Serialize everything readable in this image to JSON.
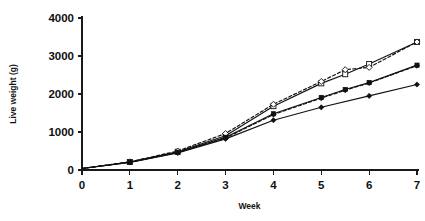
{
  "chart_data": {
    "type": "line",
    "title": "",
    "subtitle": "",
    "xlabel": "Week",
    "ylabel": "Live weight (g)",
    "xlim": [
      0,
      7
    ],
    "ylim": [
      0,
      4000
    ],
    "xticks": [
      0,
      1,
      2,
      3,
      4,
      5,
      6,
      7
    ],
    "xticklabels": [
      "0",
      "1",
      "2",
      "3",
      "4",
      "5",
      "6",
      "7"
    ],
    "yticks": [
      0,
      1000,
      2000,
      3000,
      4000
    ],
    "yticklabels": [
      "0",
      "1000",
      "2000",
      "3000",
      "4000"
    ],
    "grid": false,
    "legend": "none",
    "series": [
      {
        "name": "open-square-solid",
        "marker": "open-square",
        "linestyle": "solid",
        "x": [
          0,
          1,
          2,
          3,
          4,
          5,
          5.5,
          6,
          7
        ],
        "y": [
          40,
          210,
          480,
          900,
          1680,
          2280,
          2520,
          2790,
          3370
        ]
      },
      {
        "name": "open-diamond-dashed",
        "marker": "open-diamond",
        "linestyle": "dashed",
        "x": [
          0,
          1,
          2,
          3,
          4,
          5,
          5.5,
          6,
          7
        ],
        "y": [
          40,
          215,
          500,
          960,
          1730,
          2330,
          2640,
          2700,
          3370
        ]
      },
      {
        "name": "filled-square-solid",
        "marker": "filled-square",
        "linestyle": "solid",
        "x": [
          0,
          1,
          2,
          3,
          4,
          5,
          5.5,
          6,
          7
        ],
        "y": [
          40,
          205,
          465,
          860,
          1480,
          1910,
          2120,
          2300,
          2760
        ]
      },
      {
        "name": "filled-diamond-dashed",
        "marker": "filled-diamond",
        "linestyle": "dashed",
        "x": [
          0,
          1,
          2,
          3,
          4,
          5,
          5.5,
          6,
          7
        ],
        "y": [
          40,
          205,
          460,
          840,
          1460,
          1890,
          2100,
          2290,
          2745
        ]
      },
      {
        "name": "filled-diamond-solid-lower",
        "marker": "filled-diamond",
        "linestyle": "solid",
        "x": [
          0,
          1,
          2,
          3,
          4,
          5,
          6,
          7
        ],
        "y": [
          40,
          200,
          450,
          820,
          1310,
          1650,
          1950,
          2250
        ]
      }
    ]
  }
}
